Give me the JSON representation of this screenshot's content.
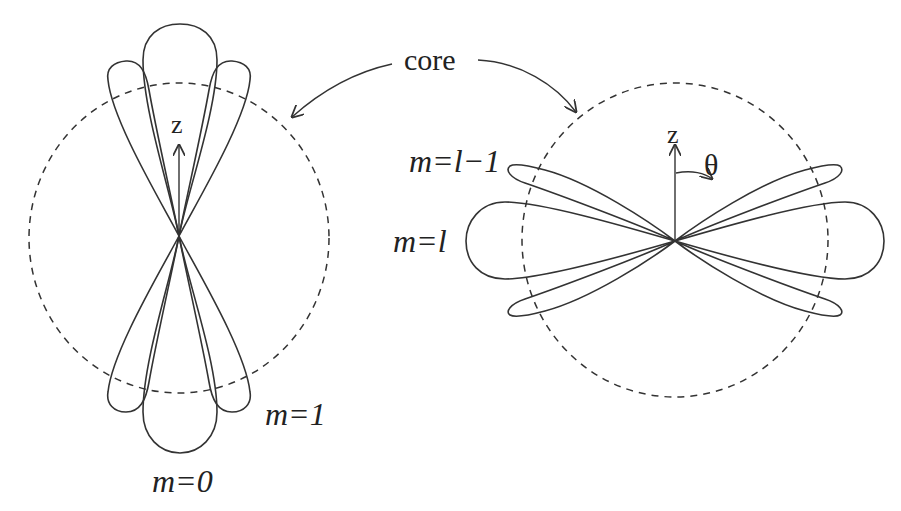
{
  "figure": {
    "core_label": "core",
    "left_panel": {
      "axis_label": "z",
      "labels": {
        "m0": "m=0",
        "m1": "m=1"
      },
      "description": "Polar lobes oriented along the z axis for m=0 (central) and m=1 (side lobes), overlaid on a dashed core circle"
    },
    "right_panel": {
      "axis_label": "z",
      "angle_label": "θ",
      "labels": {
        "ml": "m=l",
        "ml1": "m=l−1"
      },
      "description": "Polar lobes oriented perpendicular to the z axis for m=l (central) and m=l−1 (side lobes), overlaid on a dashed core circle"
    },
    "colors": {
      "stroke": "#333333",
      "background": "#ffffff"
    }
  }
}
